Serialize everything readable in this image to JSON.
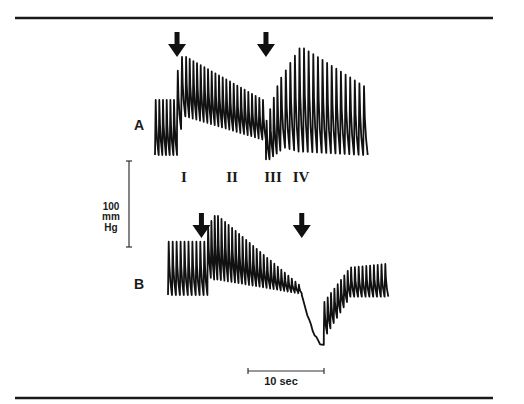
{
  "chart_data": {
    "type": "line",
    "title": "",
    "xlabel": "",
    "ylabel": "",
    "colors": {
      "trace": "#111111",
      "rule": "#1a1a1a",
      "background": "#ffffff"
    },
    "panels": [
      {
        "name": "A",
        "label": "A",
        "unit": "mmHg (relative)",
        "time_range_sec": [
          0,
          28
        ],
        "arrows_at_sec": [
          2.9,
          14.6
        ],
        "segments": [
          {
            "t0": 0.0,
            "t1": 2.9,
            "beats": 6,
            "systolic": [
              64,
              64
            ],
            "diastolic": [
              0,
              0
            ]
          },
          {
            "t0": 2.9,
            "t1": 4.0,
            "beats": 2,
            "systolic": [
              98,
              114
            ],
            "diastolic": [
              30,
              45
            ]
          },
          {
            "t0": 4.0,
            "t1": 14.6,
            "beats": 22,
            "systolic": [
              114,
              64
            ],
            "diastolic": [
              45,
              18
            ]
          },
          {
            "t0": 14.6,
            "t1": 16.5,
            "beats": 4,
            "systolic": [
              40,
              80
            ],
            "diastolic": [
              -5,
              5
            ]
          },
          {
            "t0": 16.5,
            "t1": 19.5,
            "beats": 5,
            "systolic": [
              90,
              124
            ],
            "diastolic": [
              10,
              4
            ]
          },
          {
            "t0": 19.5,
            "t1": 28.0,
            "beats": 14,
            "systolic": [
              124,
              80
            ],
            "diastolic": [
              4,
              0
            ]
          }
        ]
      },
      {
        "name": "B",
        "label": "B",
        "unit": "mmHg (relative)",
        "time_range_sec": [
          0,
          29
        ],
        "arrows_at_sec": [
          4.4,
          17.6
        ],
        "segments": [
          {
            "t0": 0.0,
            "t1": 5.2,
            "beats": 10,
            "systolic": [
              62,
              62
            ],
            "diastolic": [
              0,
              0
            ]
          },
          {
            "t0": 5.2,
            "t1": 6.5,
            "beats": 3,
            "systolic": [
              80,
              92
            ],
            "diastolic": [
              22,
              18
            ]
          },
          {
            "t0": 6.5,
            "t1": 17.6,
            "beats": 24,
            "systolic": [
              92,
              12
            ],
            "diastolic": [
              18,
              2
            ]
          },
          {
            "t0": 17.6,
            "t1": 20.5,
            "beats": 0,
            "systolic": [
              0,
              -58
            ],
            "diastolic": [
              0,
              -58
            ]
          },
          {
            "t0": 20.5,
            "t1": 24.0,
            "beats": 8,
            "systolic": [
              -8,
              28
            ],
            "diastolic": [
              -45,
              -2
            ]
          },
          {
            "t0": 24.0,
            "t1": 29.0,
            "beats": 10,
            "systolic": [
              32,
              36
            ],
            "diastolic": [
              -2,
              -2
            ]
          }
        ]
      }
    ],
    "phase_labels": [
      {
        "text": "I",
        "at_sec": 2.0
      },
      {
        "text": "II",
        "at_sec": 5.4
      },
      {
        "text": "III",
        "at_sec": 8.3
      },
      {
        "text": "IV",
        "at_sec": 10.3
      }
    ],
    "scale_bars": {
      "pressure": {
        "value": 100,
        "lines": [
          "100",
          "mm",
          "Hg"
        ]
      },
      "time": {
        "value": 10,
        "label": "10 sec"
      }
    }
  }
}
